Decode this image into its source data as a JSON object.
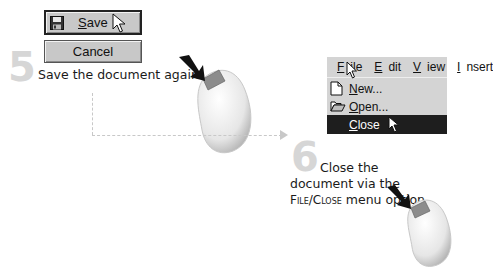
{
  "step5": {
    "number": "5",
    "caption": "Save the document again!",
    "save_button": {
      "label_underline": "S",
      "label_rest": "ave",
      "icon": "floppy-disk-icon"
    },
    "cancel_button": {
      "label": "Cancel"
    }
  },
  "step6": {
    "number": "6",
    "caption_part1": "Close the document via the ",
    "caption_menu_path": "File/Close",
    "caption_part2": " menu option.",
    "menu": {
      "bar": [
        {
          "underline": "F",
          "rest": "ile"
        },
        {
          "underline": "E",
          "rest": "dit"
        },
        {
          "underline": "V",
          "rest": "iew"
        },
        {
          "underline": "I",
          "rest": "nsert"
        }
      ],
      "items": [
        {
          "underline": "N",
          "rest": "ew...",
          "icon": "new-document-icon"
        },
        {
          "underline": "O",
          "rest": "pen...",
          "icon": "open-folder-icon"
        },
        {
          "underline": "C",
          "rest": "lose",
          "icon": "",
          "highlighted": true
        }
      ]
    }
  },
  "colors": {
    "step_number": "#d6d6d6",
    "button_face": "#c8c8c8",
    "menu_face": "#d4d4d4",
    "menu_highlight": "#1e1e1e",
    "dashed_connector": "#c8c8c8"
  }
}
